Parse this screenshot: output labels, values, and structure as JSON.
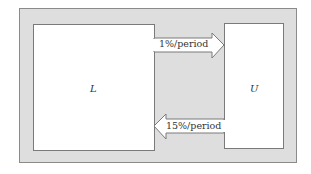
{
  "diagram": {
    "type": "stock-flow",
    "nodes": [
      {
        "id": "L",
        "label": "L"
      },
      {
        "id": "U",
        "label": "U"
      }
    ],
    "flows": [
      {
        "from": "L",
        "to": "U",
        "label": "1%/period"
      },
      {
        "from": "U",
        "to": "L",
        "label": "15%/period"
      }
    ]
  },
  "colors": {
    "frame_fill": "#dedede",
    "box_fill": "#ffffff",
    "stroke": "#7a7a7a"
  }
}
